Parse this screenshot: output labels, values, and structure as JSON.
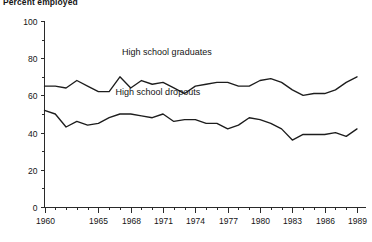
{
  "chart_data": {
    "type": "line",
    "title": "Percent employed",
    "xlabel": "",
    "ylabel": "",
    "ylim": [
      0,
      100
    ],
    "xlim": [
      1960,
      1989
    ],
    "grid": false,
    "legend_position": "inline-annotation",
    "y_ticks": [
      0,
      20,
      40,
      60,
      80,
      100
    ],
    "y_tick_labels": [
      "0",
      "20",
      "40",
      "60",
      "80",
      "100"
    ],
    "y_minor_ticks": [
      10,
      30,
      50,
      70,
      90
    ],
    "x_ticks": [
      1960,
      1965,
      1968,
      1971,
      1974,
      1977,
      1980,
      1983,
      1986,
      1989
    ],
    "x_tick_labels": [
      "1960",
      "1965",
      "1968",
      "1971",
      "1974",
      "1977",
      "1980",
      "1983",
      "1986",
      "1989"
    ],
    "x": [
      1960,
      1961,
      1962,
      1963,
      1964,
      1965,
      1966,
      1967,
      1968,
      1969,
      1970,
      1971,
      1972,
      1973,
      1974,
      1975,
      1976,
      1977,
      1978,
      1979,
      1980,
      1981,
      1982,
      1983,
      1984,
      1985,
      1986,
      1987,
      1988,
      1989
    ],
    "series": [
      {
        "name": "High school graduates",
        "label": "High school graduates",
        "label_x": 1967.2,
        "label_y": 82,
        "values": [
          65,
          65,
          64,
          68,
          65,
          62,
          62,
          70,
          64,
          68,
          66,
          67,
          64,
          61,
          65,
          66,
          67,
          67,
          65,
          65,
          68,
          69,
          67,
          63,
          60,
          61,
          61,
          63,
          67,
          70
        ]
      },
      {
        "name": "High school dropouts",
        "label": "High school dropouts",
        "label_x": 1966.6,
        "label_y": 60,
        "values": [
          52,
          50,
          43,
          46,
          44,
          45,
          48,
          50,
          50,
          49,
          48,
          50,
          46,
          47,
          47,
          45,
          45,
          42,
          44,
          48,
          47,
          45,
          42,
          36,
          39,
          39,
          39,
          40,
          38,
          42
        ]
      }
    ]
  }
}
